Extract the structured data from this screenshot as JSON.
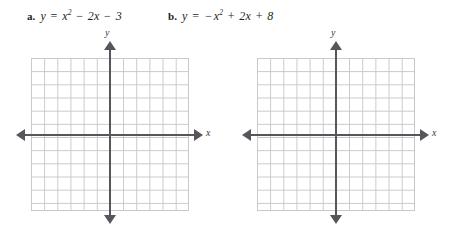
{
  "page": {
    "background_color": "#ffffff",
    "text_color": "#231f20"
  },
  "problems": [
    {
      "tag": "a.",
      "equation_plain": "y = x² − 2x − 3",
      "equation_parts": {
        "lhs": "y",
        "equals": "=",
        "term1_base": "x",
        "term1_exp": "2",
        "op1": "−",
        "term2": "2x",
        "op2": "−",
        "term3": "3"
      }
    },
    {
      "tag": "b.",
      "equation_plain": "y = −x² + 2x + 8",
      "equation_parts": {
        "lhs": "y",
        "equals": "=",
        "lead_sign": "−",
        "term1_base": "x",
        "term1_exp": "2",
        "op1": "+",
        "term2": "2x",
        "op2": "+",
        "term3": "8"
      }
    }
  ],
  "graphs": [
    {
      "id": "graph-a",
      "x_axis_label": "x",
      "y_axis_label": "y",
      "grid_columns": 12,
      "grid_rows": 11.5,
      "cell_size_px": 13.17,
      "grid_line_color": "#c9c7ca",
      "axis_color": "#58565c",
      "origin_cell_from_left": 6,
      "origin_cell_from_top": 5.8
    },
    {
      "id": "graph-b",
      "x_axis_label": "x",
      "y_axis_label": "y",
      "grid_columns": 12,
      "grid_rows": 11.5,
      "cell_size_px": 13.17,
      "grid_line_color": "#c9c7ca",
      "axis_color": "#58565c",
      "origin_cell_from_left": 6,
      "origin_cell_from_top": 5.8
    }
  ]
}
